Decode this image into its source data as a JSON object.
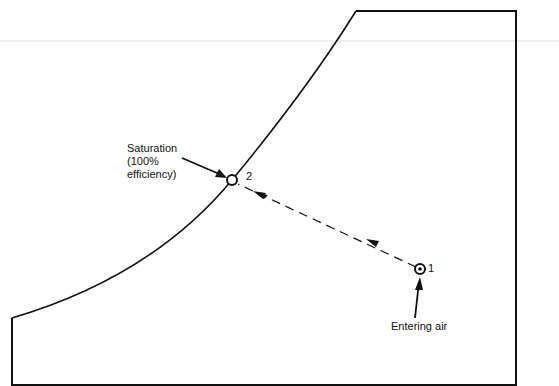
{
  "diagram": {
    "type": "psychrometric-process",
    "colors": {
      "line": "#111111",
      "background": "#ffffff",
      "artifact_line": "#d8d8d8"
    },
    "labels": {
      "saturation": "Saturation\n(100%\nefficiency)",
      "entering_air": "Entering air"
    },
    "points": [
      {
        "id": "1",
        "label": "1",
        "description": "entering air state"
      },
      {
        "id": "2",
        "label": "2",
        "description": "saturation state"
      }
    ],
    "process": {
      "from": "1",
      "to": "2",
      "line_style": "dashed",
      "arrow_count": 2
    }
  }
}
